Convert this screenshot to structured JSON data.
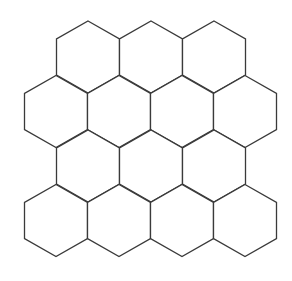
{
  "figure": {
    "background_color": "#ffffff",
    "stroke_color": "#3a3a3a",
    "fill_color": "#ffffff",
    "stroke_width": 1.3,
    "canvas": {
      "width": 292,
      "height": 281
    }
  },
  "grid": {
    "shape_name": "hexagon",
    "orientation": "pointy-top",
    "total_cells": 14,
    "row_count": 4,
    "cell_width": 63,
    "cell_height": 72,
    "row_pitch": 54.5,
    "column_pitch": 63,
    "rows": [
      {
        "index": 0,
        "cell_count": 3,
        "offset": "indented",
        "center_y": 57,
        "centers_x": [
          88,
          151,
          214
        ]
      },
      {
        "index": 1,
        "cell_count": 4,
        "offset": "outdented",
        "center_y": 111.5,
        "centers_x": [
          56,
          119,
          182,
          245
        ]
      },
      {
        "index": 2,
        "cell_count": 3,
        "offset": "indented",
        "center_y": 166,
        "centers_x": [
          88,
          151,
          214
        ]
      },
      {
        "index": 3,
        "cell_count": 4,
        "offset": "outdented",
        "center_y": 220.5,
        "centers_x": [
          56,
          119,
          182,
          245
        ]
      }
    ],
    "cells": [
      {
        "id": "hex-r0-c0",
        "row": 0,
        "col": 0,
        "cx": 88,
        "cy": 57
      },
      {
        "id": "hex-r0-c1",
        "row": 0,
        "col": 1,
        "cx": 151,
        "cy": 57
      },
      {
        "id": "hex-r0-c2",
        "row": 0,
        "col": 2,
        "cx": 214,
        "cy": 57
      },
      {
        "id": "hex-r1-c0",
        "row": 1,
        "col": 0,
        "cx": 56,
        "cy": 111.5
      },
      {
        "id": "hex-r1-c1",
        "row": 1,
        "col": 1,
        "cx": 119,
        "cy": 111.5
      },
      {
        "id": "hex-r1-c2",
        "row": 1,
        "col": 2,
        "cx": 182,
        "cy": 111.5
      },
      {
        "id": "hex-r1-c3",
        "row": 1,
        "col": 3,
        "cx": 245,
        "cy": 111.5
      },
      {
        "id": "hex-r2-c0",
        "row": 2,
        "col": 0,
        "cx": 88,
        "cy": 166
      },
      {
        "id": "hex-r2-c1",
        "row": 2,
        "col": 1,
        "cx": 151,
        "cy": 166
      },
      {
        "id": "hex-r2-c2",
        "row": 2,
        "col": 2,
        "cx": 214,
        "cy": 166
      },
      {
        "id": "hex-r3-c0",
        "row": 3,
        "col": 0,
        "cx": 56,
        "cy": 220.5
      },
      {
        "id": "hex-r3-c1",
        "row": 3,
        "col": 1,
        "cx": 119,
        "cy": 220.5
      },
      {
        "id": "hex-r3-c2",
        "row": 3,
        "col": 2,
        "cx": 182,
        "cy": 220.5
      },
      {
        "id": "hex-r3-c3",
        "row": 3,
        "col": 3,
        "cx": 245,
        "cy": 220.5
      }
    ]
  }
}
